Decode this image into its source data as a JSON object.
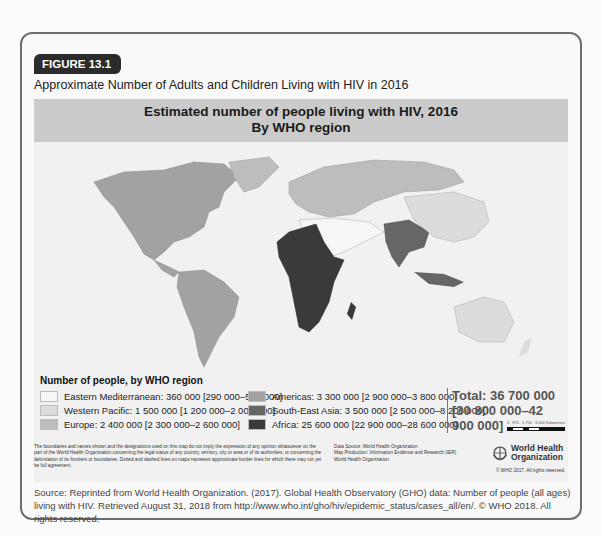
{
  "figure": {
    "tag": "FIGURE 13.1",
    "title": "Approximate Number of Adults and Children Living with HIV in 2016"
  },
  "map": {
    "header_line1": "Estimated number of people living with HIV, 2016",
    "header_line2": "By WHO region",
    "legend_title": "Number of people, by WHO region",
    "legend": [
      {
        "label": "Eastern Mediterranean: 360 000 [290 000–500 000]",
        "color": "#f6f6f6"
      },
      {
        "label": "Western Pacific: 1 500 000 [1 200 000–2 000 000]",
        "color": "#dcdcdc"
      },
      {
        "label": "Europe: 2 400 000 [2 300 000–2 600 000]",
        "color": "#bdbdbd"
      },
      {
        "label": "Americas: 3 300 000 [2 900 000–3 800 000]",
        "color": "#a2a2a2"
      },
      {
        "label": "South-East Asia: 3 500 000 [2 500 000–8 200 000]",
        "color": "#666666"
      },
      {
        "label": "Africa: 25 600 000 [22 900 000–28 600 000]",
        "color": "#3a3a3a"
      }
    ],
    "total_line1": "Total: 36 700 000",
    "total_line2": "[30 800 000–42 900 000]",
    "scale": {
      "labels": [
        "0",
        "875",
        "1,750",
        "3,500 Kilometers"
      ]
    },
    "disclaimer": "The boundaries and names shown and the designations used on this map do not imply the expression of any opinion whatsoever on the part of the World Health Organization concerning the legal status of any country, territory, city or area or of its authorities, or concerning the delimitation of its frontiers or boundaries. Dotted and dashed lines on maps represent approximate border lines for which there may not yet be full agreement.",
    "data_source": [
      "Data Source: World Health Organization",
      "Map Production: Information Evidence and Research (IER)",
      "World Health Organization"
    ],
    "who_logo": {
      "line1": "World Health",
      "line2": "Organization",
      "icon": "who-emblem-icon"
    },
    "copyright": "© WHO 2017. All rights reserved."
  },
  "source": "Source: Reprinted from World Health Organization. (2017). Global Health Observatory (GHO) data: Number of people (all ages) living with HIV. Retrieved August 31, 2018 from http://www.who.int/gho/hiv/epidemic_status/cases_all/en/.  © WHO 2018. All rights reserved."
}
